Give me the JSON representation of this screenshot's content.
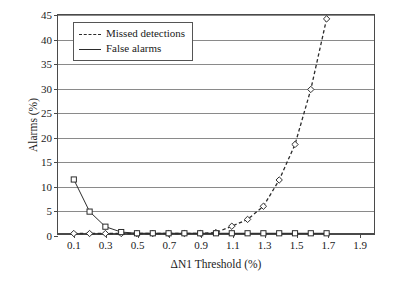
{
  "chart_data": {
    "type": "line",
    "title": "",
    "xlabel": "ΔN1 Threshold (%)",
    "ylabel": "Alarms (%)",
    "xlim": [
      0.0,
      2.0
    ],
    "ylim": [
      0,
      45
    ],
    "xticks": [
      0.1,
      0.3,
      0.5,
      0.7,
      0.9,
      1.1,
      1.3,
      1.5,
      1.7,
      1.9
    ],
    "xtick_labels": [
      "0.1",
      "0.3",
      "0.5",
      "0.7",
      "0.9",
      "1.1",
      "1.3",
      "1.5",
      "1.7",
      "1.9"
    ],
    "yticks": [
      0,
      5,
      10,
      15,
      20,
      25,
      30,
      35,
      40,
      45
    ],
    "ytick_labels": [
      "0",
      "5",
      "10",
      "15",
      "20",
      "25",
      "30",
      "35",
      "40",
      "45"
    ],
    "grid": "horizontal",
    "legend_position": "upper left",
    "x": [
      0.1,
      0.2,
      0.3,
      0.4,
      0.5,
      0.6,
      0.7,
      0.8,
      0.9,
      1.0,
      1.1,
      1.2,
      1.3,
      1.4,
      1.5,
      1.6,
      1.7
    ],
    "series": [
      {
        "name": "Missed detections",
        "linestyle": "dashed",
        "marker": "diamond",
        "color": "#2b2b2b",
        "values": [
          0.1,
          0.1,
          0.1,
          0.1,
          0.1,
          0.1,
          0.1,
          0.1,
          0.15,
          0.3,
          1.6,
          3.0,
          5.7,
          11.1,
          18.4,
          29.7,
          44.2
        ]
      },
      {
        "name": "False alarms",
        "linestyle": "solid",
        "marker": "square",
        "color": "#2b2b2b",
        "values": [
          11.2,
          4.6,
          1.5,
          0.4,
          0.15,
          0.15,
          0.15,
          0.15,
          0.15,
          0.15,
          0.15,
          0.15,
          0.15,
          0.15,
          0.15,
          0.15,
          0.15
        ]
      }
    ]
  },
  "legend": {
    "items": [
      {
        "label": "Missed detections"
      },
      {
        "label": "False alarms"
      }
    ]
  }
}
